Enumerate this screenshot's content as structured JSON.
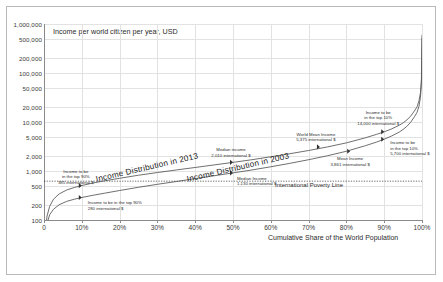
{
  "chart_data": {
    "type": "line",
    "title": "Income per world citizen per year, USD",
    "xlabel": "Cumulative Share of the World Population",
    "ylabel": "Income per world citizen per year, USD",
    "yscale": "log",
    "ylim": [
      100,
      1000000
    ],
    "xlim": [
      0,
      100
    ],
    "grid": true,
    "legend_position": "inline-labels",
    "ytick_labels": [
      "100",
      "200",
      "500",
      "1,000",
      "2,000",
      "5,000",
      "10,000",
      "20,000",
      "50,000",
      "100,000",
      "200,000",
      "500,000",
      "1,000,000"
    ],
    "ytick_values": [
      100,
      200,
      500,
      1000,
      2000,
      5000,
      10000,
      20000,
      50000,
      100000,
      200000,
      500000,
      1000000
    ],
    "xtick_labels": [
      "0",
      "10%",
      "20%",
      "30%",
      "40%",
      "50%",
      "60%",
      "70%",
      "80%",
      "90%",
      "100%"
    ],
    "xtick_values": [
      0,
      10,
      20,
      30,
      40,
      50,
      60,
      70,
      80,
      90,
      100
    ],
    "series": [
      {
        "name": "Income Distribution in 2013",
        "x": [
          0.3,
          0.8,
          1.5,
          2.5,
          4,
          6,
          8,
          10,
          13,
          16,
          20,
          25,
          30,
          35,
          40,
          45,
          50,
          55,
          60,
          65,
          70,
          75,
          80,
          85,
          88,
          90,
          92,
          94,
          95,
          96,
          97,
          98,
          98.7,
          99.2,
          99.6,
          99.85,
          100
        ],
        "y": [
          55,
          120,
          190,
          265,
          340,
          410,
          460,
          505,
          570,
          630,
          710,
          820,
          930,
          1050,
          1180,
          1330,
          1500,
          1700,
          1950,
          2250,
          2620,
          3100,
          3750,
          4750,
          5600,
          6300,
          7250,
          8600,
          9600,
          11000,
          13200,
          16800,
          20500,
          27000,
          40000,
          75000,
          600000
        ]
      },
      {
        "name": "Income Distribution in 2003",
        "x": [
          0.3,
          0.8,
          1.5,
          2.5,
          4,
          6,
          8,
          10,
          13,
          16,
          20,
          25,
          30,
          35,
          40,
          45,
          50,
          55,
          60,
          65,
          70,
          75,
          80,
          85,
          88,
          90,
          92,
          94,
          95,
          96,
          97,
          98,
          98.7,
          99.2,
          99.6,
          99.85,
          100
        ],
        "y": [
          42,
          85,
          128,
          165,
          205,
          240,
          265,
          288,
          320,
          352,
          400,
          465,
          535,
          610,
          700,
          800,
          915,
          1050,
          1220,
          1430,
          1700,
          2050,
          2530,
          3280,
          3900,
          4450,
          5200,
          6250,
          7050,
          8150,
          9900,
          12800,
          15800,
          21000,
          32000,
          62000,
          520000
        ]
      }
    ],
    "reference_lines": [
      {
        "name": "International Poverty Line",
        "y": 620,
        "style": "dotted"
      }
    ],
    "annotations": [
      {
        "name": "bottom-10-2013",
        "line1": "Income to be",
        "line2": "in the top 90%",
        "line3": "385 international $",
        "x": 10,
        "y": 505
      },
      {
        "name": "bottom-10-2003",
        "line1": "Income to be in the top 90%",
        "line2": "280 international $",
        "x": 10,
        "y": 288
      },
      {
        "name": "median-2013",
        "line1": "Median income",
        "line2": "2,010 international $",
        "x": 50,
        "y": 1500
      },
      {
        "name": "median-2003",
        "line1": "Median Income",
        "line2": "1,130 international $",
        "x": 50,
        "y": 915
      },
      {
        "name": "world-mean-income",
        "line1": "World Mean Income",
        "line2": "5,375 international $",
        "x": 73,
        "y": 3100
      },
      {
        "name": "mean-income-2003",
        "line1": "Mean Income",
        "line2": "3,861 international $",
        "x": 81,
        "y": 2530
      },
      {
        "name": "top-10-2013",
        "line1": "Income to be",
        "line2": "in the top 10%",
        "line3": "14,000 international $",
        "x": 90,
        "y": 6300
      },
      {
        "name": "top-10-2003",
        "line1": "Income to be",
        "line2": "in the top 10%",
        "line3": "5,700 international $",
        "x": 90,
        "y": 4450
      }
    ]
  },
  "chart": {
    "title": "Income per world citizen per year, USD",
    "xaxis_title": "Cumulative Share of the World Population",
    "poverty_line_label": "International Poverty Line",
    "curve_label_2013": "Income Distribution in 2013",
    "curve_label_2003": "Income Distribution in 2003",
    "anno": {
      "b10_2013_l1": "Income to be",
      "b10_2013_l2": "in the top 90%",
      "b10_2013_l3": "385 international $",
      "b10_2003_l1": "Income to be in the top 90%",
      "b10_2003_l2": "280 international $",
      "med_2013_l1": "Median income",
      "med_2013_l2": "2,010 international $",
      "med_2003_l1": "Median Income",
      "med_2003_l2": "1,130 international $",
      "wmi_l1": "World Mean Income",
      "wmi_l2": "5,375 international $",
      "mi_l1": "Mean Income",
      "mi_l2": "3,861 international $",
      "t10_2013_l1": "Income to be",
      "t10_2013_l2": "in the top 10%",
      "t10_2013_l3": "14,000 international $",
      "t10_2003_l1": "Income to be",
      "t10_2003_l2": "in the top 10%",
      "t10_2003_l3": "5,700 international $"
    }
  }
}
